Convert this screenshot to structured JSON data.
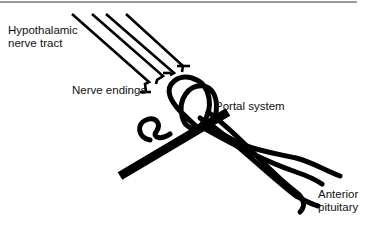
{
  "diagram": {
    "labels": {
      "hypothalamic_tract": [
        "Hypothalamic",
        "nerve tract"
      ],
      "nerve_endings": "Nerve endings",
      "portal_system": "Portal system",
      "anterior_pituitary": [
        "Anterior",
        "pituitary"
      ]
    },
    "colors": {
      "stroke": "#000000",
      "background": "#ffffff",
      "rule": "#9a9a9a"
    }
  }
}
